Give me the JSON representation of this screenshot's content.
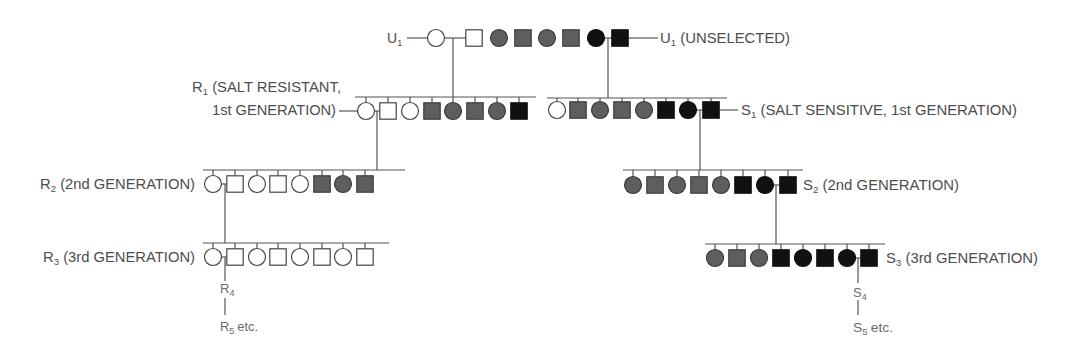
{
  "diagram": {
    "type": "pedigree"
  },
  "colors": {
    "open": "#ffffff",
    "gray": "#5e5e5e",
    "solid": "#111111",
    "outline": "#444444",
    "line": "#555555",
    "text": "#4d4d4d"
  },
  "legend_semantics": {
    "circle": "female",
    "square": "male",
    "open": "white / unfilled",
    "gray": "gray filled",
    "solid": "black filled"
  },
  "labels": {
    "u1_left": {
      "letter": "U",
      "sub": "1",
      "text": ""
    },
    "u1_right": {
      "letter": "U",
      "sub": "1",
      "text": "(UNSELECTED)"
    },
    "r1": {
      "letter": "R",
      "sub": "1",
      "text": "(SALT RESISTANT,",
      "line2": "1st GENERATION)"
    },
    "s1": {
      "letter": "S",
      "sub": "1",
      "text": "(SALT SENSITIVE, 1st GENERATION)"
    },
    "r2": {
      "letter": "R",
      "sub": "2",
      "text": "(2nd GENERATION)"
    },
    "s2": {
      "letter": "S",
      "sub": "2",
      "text": "(2nd GENERATION)"
    },
    "r3": {
      "letter": "R",
      "sub": "3",
      "text": "(3rd GENERATION)"
    },
    "s3": {
      "letter": "S",
      "sub": "3",
      "text": "(3rd GENERATION)"
    },
    "r4": {
      "letter": "R",
      "sub": "4",
      "text": ""
    },
    "r5": {
      "letter": "R",
      "sub": "5",
      "text": "etc."
    },
    "s4": {
      "letter": "S",
      "sub": "4",
      "text": ""
    },
    "s5": {
      "letter": "S",
      "sub": "5",
      "text": "etc."
    }
  },
  "generations": [
    {
      "id": "u1",
      "name": "U1 founders (unselected)",
      "members": [
        {
          "sex": "female",
          "shade": "open"
        },
        {
          "sex": "male",
          "shade": "open"
        },
        {
          "sex": "female",
          "shade": "gray"
        },
        {
          "sex": "male",
          "shade": "gray"
        },
        {
          "sex": "female",
          "shade": "gray"
        },
        {
          "sex": "male",
          "shade": "gray"
        },
        {
          "sex": "female",
          "shade": "solid"
        },
        {
          "sex": "male",
          "shade": "solid"
        }
      ],
      "matings": [
        [
          0,
          1
        ],
        [
          6,
          7
        ]
      ]
    },
    {
      "id": "r1",
      "name": "R1 salt resistant, 1st generation",
      "members": [
        {
          "sex": "female",
          "shade": "open"
        },
        {
          "sex": "male",
          "shade": "open"
        },
        {
          "sex": "female",
          "shade": "open"
        },
        {
          "sex": "male",
          "shade": "gray"
        },
        {
          "sex": "female",
          "shade": "gray"
        },
        {
          "sex": "male",
          "shade": "gray"
        },
        {
          "sex": "female",
          "shade": "gray"
        },
        {
          "sex": "male",
          "shade": "solid"
        }
      ],
      "matings": [
        [
          0,
          1
        ]
      ]
    },
    {
      "id": "s1",
      "name": "S1 salt sensitive, 1st generation",
      "members": [
        {
          "sex": "female",
          "shade": "open"
        },
        {
          "sex": "male",
          "shade": "gray"
        },
        {
          "sex": "female",
          "shade": "gray"
        },
        {
          "sex": "male",
          "shade": "gray"
        },
        {
          "sex": "female",
          "shade": "gray"
        },
        {
          "sex": "male",
          "shade": "solid"
        },
        {
          "sex": "female",
          "shade": "solid"
        },
        {
          "sex": "male",
          "shade": "solid"
        }
      ],
      "matings": [
        [
          6,
          7
        ]
      ]
    },
    {
      "id": "r2",
      "name": "R2 2nd generation",
      "members": [
        {
          "sex": "female",
          "shade": "open"
        },
        {
          "sex": "male",
          "shade": "open"
        },
        {
          "sex": "female",
          "shade": "open"
        },
        {
          "sex": "male",
          "shade": "open"
        },
        {
          "sex": "female",
          "shade": "open"
        },
        {
          "sex": "male",
          "shade": "gray"
        },
        {
          "sex": "female",
          "shade": "gray"
        },
        {
          "sex": "male",
          "shade": "gray"
        }
      ],
      "matings": [
        [
          0,
          1
        ]
      ]
    },
    {
      "id": "s2",
      "name": "S2 2nd generation",
      "members": [
        {
          "sex": "female",
          "shade": "gray"
        },
        {
          "sex": "male",
          "shade": "gray"
        },
        {
          "sex": "female",
          "shade": "gray"
        },
        {
          "sex": "male",
          "shade": "gray"
        },
        {
          "sex": "female",
          "shade": "gray"
        },
        {
          "sex": "male",
          "shade": "solid"
        },
        {
          "sex": "female",
          "shade": "solid"
        },
        {
          "sex": "male",
          "shade": "solid"
        }
      ],
      "matings": [
        [
          6,
          7
        ]
      ]
    },
    {
      "id": "r3",
      "name": "R3 3rd generation",
      "members": [
        {
          "sex": "female",
          "shade": "open"
        },
        {
          "sex": "male",
          "shade": "open"
        },
        {
          "sex": "female",
          "shade": "open"
        },
        {
          "sex": "male",
          "shade": "open"
        },
        {
          "sex": "female",
          "shade": "open"
        },
        {
          "sex": "male",
          "shade": "open"
        },
        {
          "sex": "female",
          "shade": "open"
        },
        {
          "sex": "male",
          "shade": "open"
        }
      ],
      "matings": [
        [
          0,
          1
        ]
      ]
    },
    {
      "id": "s3",
      "name": "S3 3rd generation",
      "members": [
        {
          "sex": "female",
          "shade": "gray"
        },
        {
          "sex": "male",
          "shade": "gray"
        },
        {
          "sex": "female",
          "shade": "gray"
        },
        {
          "sex": "male",
          "shade": "solid"
        },
        {
          "sex": "female",
          "shade": "solid"
        },
        {
          "sex": "male",
          "shade": "solid"
        },
        {
          "sex": "female",
          "shade": "solid"
        },
        {
          "sex": "male",
          "shade": "solid"
        }
      ],
      "matings": [
        [
          6,
          7
        ]
      ]
    }
  ]
}
